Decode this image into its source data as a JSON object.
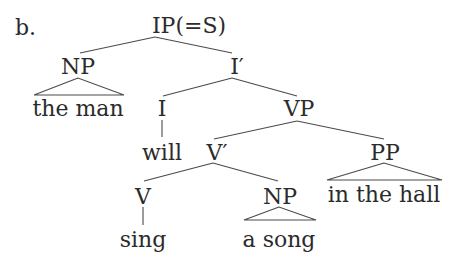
{
  "diagram": {
    "type": "syntax-tree",
    "label": "b.",
    "colors": {
      "text": "#2b2b2b",
      "lines": "#4a4a4a",
      "background": "#ffffff"
    },
    "nodes": {
      "ip": "IP(=S)",
      "np_subject": "NP",
      "i_bar": "I′",
      "i": "I",
      "vp": "VP",
      "v_bar": "V′",
      "pp": "PP",
      "v": "V",
      "np_object": "NP"
    },
    "leaves": {
      "subject": "the man",
      "aux": "will",
      "verb": "sing",
      "object": "a song",
      "pp_phrase": "in the hall"
    },
    "edges": [
      [
        "IP(=S)",
        "NP"
      ],
      [
        "IP(=S)",
        "I′"
      ],
      [
        "NP",
        "the man",
        "triangle"
      ],
      [
        "I′",
        "I"
      ],
      [
        "I′",
        "VP"
      ],
      [
        "I",
        "will"
      ],
      [
        "VP",
        "V′"
      ],
      [
        "VP",
        "PP"
      ],
      [
        "V′",
        "V"
      ],
      [
        "V′",
        "NP"
      ],
      [
        "V",
        "sing"
      ],
      [
        "NP",
        "a song",
        "triangle"
      ],
      [
        "PP",
        "in the hall",
        "triangle"
      ]
    ]
  }
}
